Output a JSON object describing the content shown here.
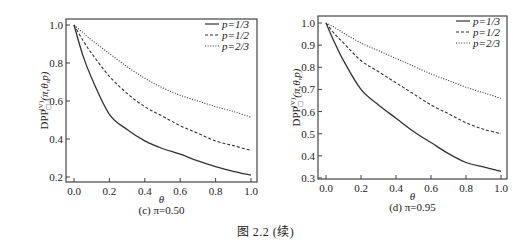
{
  "figure_caption": "图 2.2  (续)",
  "colors": {
    "axis": "#444444",
    "line": "#333333",
    "background": "#ffffff"
  },
  "chart_data": [
    {
      "type": "line",
      "panel": "c",
      "caption": "(c) π=0.50",
      "title": "",
      "xlabel": "θ",
      "ylabel": "DPP□(V)(π,θ,p)",
      "xlim": [
        -0.03,
        1.03
      ],
      "ylim": [
        0.18,
        1.03
      ],
      "xticks": [
        0.0,
        0.2,
        0.4,
        0.6,
        0.8,
        1.0
      ],
      "xtick_labels": [
        "0.0",
        "0.2",
        "0.4",
        "0.6",
        "0.8",
        "1.0"
      ],
      "yticks": [
        0.2,
        0.4,
        0.6,
        0.8,
        1.0
      ],
      "ytick_labels": [
        "0.2",
        "0.4",
        "0.6",
        "0.8",
        "1.0"
      ],
      "grid": false,
      "legend_position": "upper right",
      "x": [
        0.0,
        0.05,
        0.1,
        0.2,
        0.3,
        0.4,
        0.5,
        0.6,
        0.7,
        0.8,
        0.9,
        1.0
      ],
      "series": [
        {
          "name": "p=1/3",
          "style": "solid",
          "values": [
            1.0,
            0.84,
            0.72,
            0.53,
            0.45,
            0.39,
            0.35,
            0.32,
            0.285,
            0.255,
            0.23,
            0.21
          ]
        },
        {
          "name": "p=1/2",
          "style": "dashed",
          "values": [
            1.0,
            0.92,
            0.85,
            0.73,
            0.64,
            0.57,
            0.52,
            0.47,
            0.43,
            0.39,
            0.365,
            0.34
          ]
        },
        {
          "name": "p=2/3",
          "style": "dotted",
          "values": [
            1.0,
            0.96,
            0.92,
            0.85,
            0.78,
            0.72,
            0.67,
            0.63,
            0.6,
            0.57,
            0.545,
            0.515
          ]
        }
      ]
    },
    {
      "type": "line",
      "panel": "d",
      "caption": "(d) π=0.95",
      "title": "",
      "xlabel": "θ",
      "ylabel": "DPP□(V)(π,θ,p)",
      "xlim": [
        -0.03,
        1.03
      ],
      "ylim": [
        0.3,
        1.03
      ],
      "xticks": [
        0.0,
        0.2,
        0.4,
        0.6,
        0.8,
        1.0
      ],
      "xtick_labels": [
        "0.0",
        "0.2",
        "0.4",
        "0.6",
        "0.8",
        "1.0"
      ],
      "yticks": [
        0.3,
        0.4,
        0.5,
        0.6,
        0.7,
        0.8,
        0.9,
        1.0
      ],
      "ytick_labels": [
        "0.3",
        "0.4",
        "0.5",
        "0.6",
        "0.7",
        "0.8",
        "0.9",
        "1.0"
      ],
      "grid": false,
      "legend_position": "upper right",
      "x": [
        0.0,
        0.05,
        0.1,
        0.2,
        0.3,
        0.4,
        0.5,
        0.6,
        0.7,
        0.8,
        0.9,
        1.0
      ],
      "series": [
        {
          "name": "p=1/3",
          "style": "solid",
          "values": [
            1.0,
            0.91,
            0.83,
            0.7,
            0.63,
            0.57,
            0.51,
            0.46,
            0.41,
            0.37,
            0.35,
            0.33
          ]
        },
        {
          "name": "p=1/2",
          "style": "dashed",
          "values": [
            1.0,
            0.95,
            0.91,
            0.83,
            0.78,
            0.73,
            0.68,
            0.63,
            0.59,
            0.55,
            0.52,
            0.5
          ]
        },
        {
          "name": "p=2/3",
          "style": "dotted",
          "values": [
            1.0,
            0.98,
            0.955,
            0.91,
            0.875,
            0.84,
            0.805,
            0.77,
            0.74,
            0.71,
            0.685,
            0.66
          ]
        }
      ]
    }
  ]
}
